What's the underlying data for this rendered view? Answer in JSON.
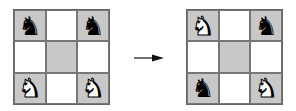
{
  "diagram": {
    "colors": {
      "shaded": "#c8c8c8",
      "light": "#ffffff",
      "border": "#777777"
    },
    "boards": [
      {
        "name": "initial",
        "cells": [
          {
            "shade": "shaded",
            "piece": "black-knight",
            "glyph": "♞"
          },
          {
            "shade": "light",
            "piece": "",
            "glyph": ""
          },
          {
            "shade": "shaded",
            "piece": "black-knight",
            "glyph": "♞"
          },
          {
            "shade": "light",
            "piece": "",
            "glyph": ""
          },
          {
            "shade": "shaded",
            "piece": "",
            "glyph": ""
          },
          {
            "shade": "light",
            "piece": "",
            "glyph": ""
          },
          {
            "shade": "shaded",
            "piece": "white-knight",
            "glyph": "♞"
          },
          {
            "shade": "light",
            "piece": "",
            "glyph": ""
          },
          {
            "shade": "shaded",
            "piece": "white-knight",
            "glyph": "♞"
          }
        ]
      },
      {
        "name": "final",
        "cells": [
          {
            "shade": "shaded",
            "piece": "white-knight",
            "glyph": "♞"
          },
          {
            "shade": "light",
            "piece": "",
            "glyph": ""
          },
          {
            "shade": "shaded",
            "piece": "black-knight",
            "glyph": "♞"
          },
          {
            "shade": "light",
            "piece": "",
            "glyph": ""
          },
          {
            "shade": "shaded",
            "piece": "",
            "glyph": ""
          },
          {
            "shade": "light",
            "piece": "",
            "glyph": ""
          },
          {
            "shade": "shaded",
            "piece": "black-knight",
            "glyph": "♞"
          },
          {
            "shade": "light",
            "piece": "",
            "glyph": ""
          },
          {
            "shade": "shaded",
            "piece": "white-knight",
            "glyph": "♞"
          }
        ]
      }
    ],
    "arrow": "right-arrow"
  }
}
